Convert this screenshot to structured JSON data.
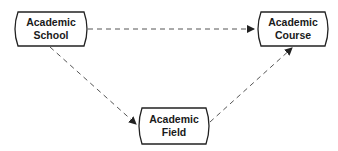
{
  "diagram": {
    "nodes": [
      {
        "id": "school",
        "line1": "Academic",
        "line2": "School"
      },
      {
        "id": "course",
        "line1": "Academic",
        "line2": "Course"
      },
      {
        "id": "field",
        "line1": "Academic",
        "line2": "Field"
      }
    ],
    "edges": [
      {
        "from": "school",
        "to": "course",
        "style": "dashed"
      },
      {
        "from": "school",
        "to": "field",
        "style": "dashed"
      },
      {
        "from": "field",
        "to": "course",
        "style": "dashed"
      }
    ],
    "colors": {
      "stroke": "#222222",
      "edge": "#555555",
      "background": "#ffffff"
    }
  }
}
